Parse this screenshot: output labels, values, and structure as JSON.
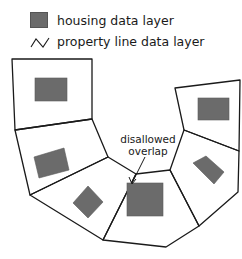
{
  "legend": {
    "items": [
      {
        "icon": "filled-gray-square",
        "label": "housing data layer"
      },
      {
        "icon": "zigzag-line",
        "label": "property line data layer"
      }
    ]
  },
  "annotation": {
    "line1": "disallowed",
    "line2": "overlap"
  },
  "colors": {
    "housing_fill": "#6b6b6b",
    "property_line": "#1a1a1a",
    "background": "#ffffff"
  },
  "parcels": [
    {
      "id": "parcel-1",
      "has_house": true
    },
    {
      "id": "parcel-2",
      "has_house": true
    },
    {
      "id": "parcel-3",
      "has_house": true
    },
    {
      "id": "parcel-4",
      "has_house": true,
      "overlap": true
    },
    {
      "id": "parcel-5",
      "has_house": true
    },
    {
      "id": "parcel-6",
      "has_house": true
    }
  ]
}
